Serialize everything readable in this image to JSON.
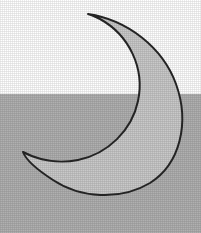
{
  "scene": {
    "title": "Crescent Moon",
    "canvas": {
      "width": 201,
      "height": 233
    },
    "background": {
      "upper_color": "#ffffff",
      "lower_color": "#b0b0b0",
      "horizon_y": 94,
      "texture": "halftone-dither"
    }
  },
  "moon": {
    "label": "crescent-moon",
    "fill_color": "#c9c9c9",
    "outline_color": "#262626",
    "outline_width": 2,
    "orientation": "waxing-crescent-opening-left",
    "bounds": {
      "x": 23,
      "y": 14,
      "width": 161,
      "height": 179
    },
    "tips": {
      "upper_tip": {
        "x": 88,
        "y": 14
      },
      "lower_tip": {
        "x": 23,
        "y": 152
      }
    },
    "extents": {
      "rightmost_x": 184,
      "bottom_y": 193
    },
    "outer_arc": "large circular arc sweeping right from upper tip down to lower tip",
    "inner_arc": "concave arc bowing right, carving the crescent opening toward lower-left"
  }
}
